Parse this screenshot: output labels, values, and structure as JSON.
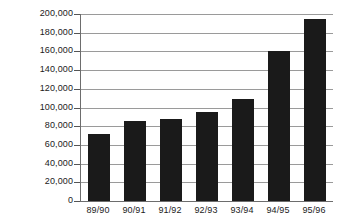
{
  "chart_data": {
    "type": "bar",
    "title": "",
    "subtitle": "",
    "xlabel": "",
    "ylabel": "",
    "categories": [
      "89/90",
      "90/91",
      "91/92",
      "92/93",
      "93/94",
      "94/95",
      "95/96"
    ],
    "values": [
      72000,
      86000,
      87500,
      95500,
      109000,
      160000,
      195000
    ],
    "series": [
      {
        "name": "",
        "values": [
          72000,
          86000,
          87500,
          95500,
          109000,
          160000,
          195000
        ]
      }
    ],
    "ylim": [
      0,
      200000
    ],
    "ytick_values": [
      0,
      20000,
      40000,
      60000,
      80000,
      100000,
      120000,
      140000,
      160000,
      180000,
      200000
    ],
    "ytick_labels": [
      "0",
      "20,000",
      "40,000",
      "60,000",
      "80,000",
      "100,000",
      "120,000",
      "140,000",
      "160,000",
      "180,000",
      "200,000"
    ],
    "grid": true,
    "grid_axis": "y",
    "legend": false,
    "legend_position": "none",
    "annotations": [],
    "colors": {
      "bar_fill": "#1a1a1a",
      "gridline": "#9a9a9a",
      "axis_line": "#6d6d6d",
      "text": "#1b1b1b",
      "background": "#ffffff"
    }
  }
}
